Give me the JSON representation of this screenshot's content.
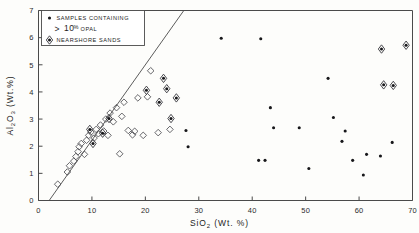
{
  "figure": {
    "background": "#fdfdfb",
    "ink_color": "#2b2b2b"
  },
  "axes": {
    "x": {
      "title_main": "SiO",
      "title_sub": "2",
      "title_unit": "(Wt. %)",
      "ticks": [
        "0",
        "10",
        "20",
        "30",
        "40",
        "50",
        "60",
        "70"
      ],
      "tick_values": [
        0,
        10,
        20,
        30,
        40,
        50,
        60,
        70
      ],
      "min": 0,
      "max": 70
    },
    "y": {
      "title_main": "Al",
      "title_sub": "2",
      "title_main2": "O",
      "title_sub2": "3",
      "title_unit": "(Wt.%)",
      "ticks": [
        "0",
        "1",
        "2",
        "3",
        "4",
        "5",
        "6",
        "7"
      ],
      "tick_values": [
        0,
        1,
        2,
        3,
        4,
        5,
        6,
        7
      ],
      "min": 0,
      "max": 7
    }
  },
  "legend": {
    "entries": [
      {
        "marker": "filled-dot",
        "line1": "SAMPLES  CONTAINING",
        "gt": ">",
        "amount": "10",
        "percent": "%",
        "line2": "OPAL"
      },
      {
        "marker": "dotted-diamond",
        "line1": "NEARSHORE  SANDS"
      }
    ]
  },
  "chart_data": {
    "type": "scatter",
    "title": "",
    "xlabel": "SiO2 (Wt. %)",
    "ylabel": "Al2O3 (Wt.%)",
    "xlim": [
      0,
      70
    ],
    "ylim": [
      0,
      7
    ],
    "grid": false,
    "legend_position": "upper-left",
    "annotations": [
      {
        "type": "line",
        "label": "trend line",
        "x": [
          2.0,
          27.2
        ],
        "y": [
          0.0,
          7.0
        ]
      }
    ],
    "series": [
      {
        "name": "open diamonds (other samples)",
        "marker": "open-diamond",
        "points": [
          [
            3.6,
            0.6
          ],
          [
            5.4,
            1.05
          ],
          [
            5.8,
            1.28
          ],
          [
            6.6,
            1.45
          ],
          [
            7.0,
            1.62
          ],
          [
            7.4,
            1.8
          ],
          [
            7.6,
            1.98
          ],
          [
            8.0,
            2.1
          ],
          [
            8.6,
            1.7
          ],
          [
            9.0,
            2.22
          ],
          [
            9.4,
            2.4
          ],
          [
            9.8,
            2.52
          ],
          [
            10.4,
            2.3
          ],
          [
            10.8,
            2.62
          ],
          [
            11.2,
            2.46
          ],
          [
            11.6,
            2.78
          ],
          [
            12.2,
            2.56
          ],
          [
            12.6,
            3.0
          ],
          [
            13.0,
            2.4
          ],
          [
            13.4,
            3.22
          ],
          [
            14.0,
            2.9
          ],
          [
            14.6,
            3.42
          ],
          [
            15.2,
            1.72
          ],
          [
            15.6,
            3.1
          ],
          [
            16.0,
            3.62
          ],
          [
            16.8,
            2.58
          ],
          [
            17.6,
            2.42
          ],
          [
            18.0,
            2.55
          ],
          [
            18.6,
            3.78
          ],
          [
            19.6,
            2.4
          ],
          [
            20.4,
            3.82
          ],
          [
            21.0,
            4.78
          ],
          [
            22.4,
            2.5
          ],
          [
            24.6,
            2.62
          ]
        ]
      },
      {
        "name": "nearshore sands",
        "marker": "dotted-diamond",
        "points": [
          [
            9.6,
            2.62
          ],
          [
            10.2,
            2.1
          ],
          [
            12.0,
            2.48
          ],
          [
            13.2,
            3.02
          ],
          [
            20.2,
            4.06
          ],
          [
            22.6,
            3.62
          ],
          [
            23.4,
            4.5
          ],
          [
            24.0,
            4.12
          ],
          [
            24.8,
            3.02
          ],
          [
            25.8,
            3.78
          ],
          [
            68.8,
            5.72
          ],
          [
            64.6,
            4.26
          ],
          [
            66.4,
            4.24
          ],
          [
            64.2,
            5.58
          ]
        ]
      },
      {
        "name": "samples containing > 10% opal",
        "marker": "filled-dot",
        "points": [
          [
            27.6,
            2.58
          ],
          [
            28.0,
            1.98
          ],
          [
            34.2,
            5.98
          ],
          [
            41.6,
            5.96
          ],
          [
            41.2,
            1.48
          ],
          [
            42.4,
            1.48
          ],
          [
            43.4,
            3.42
          ],
          [
            44.0,
            2.68
          ],
          [
            48.8,
            2.68
          ],
          [
            50.6,
            1.18
          ],
          [
            54.2,
            4.5
          ],
          [
            55.2,
            3.06
          ],
          [
            56.8,
            2.18
          ],
          [
            57.4,
            2.56
          ],
          [
            58.8,
            1.48
          ],
          [
            60.8,
            0.94
          ],
          [
            61.4,
            1.7
          ],
          [
            64.0,
            1.64
          ],
          [
            66.2,
            2.14
          ]
        ]
      }
    ]
  }
}
